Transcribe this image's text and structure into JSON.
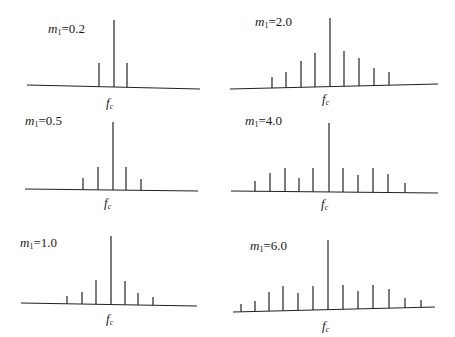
{
  "line_color": "#222222",
  "panels": [
    {
      "id": "p1",
      "label_var": "m",
      "label_sub": "1",
      "label_value": "=0.2",
      "label_pos": [
        48,
        22
      ],
      "fc_pos": [
        106,
        96
      ],
      "baseline": [
        27,
        85,
        200,
        89
      ],
      "lines": [
        [
          99,
          63
        ],
        [
          114,
          20
        ],
        [
          127,
          63
        ]
      ]
    },
    {
      "id": "p2",
      "label_var": "m",
      "label_sub": "1",
      "label_value": "=2.0",
      "label_pos": [
        255,
        15
      ],
      "fc_pos": [
        322,
        92
      ],
      "baseline": [
        230,
        89,
        438,
        84
      ],
      "lines": [
        [
          272,
          77
        ],
        [
          286,
          72
        ],
        [
          301,
          61
        ],
        [
          315,
          53
        ],
        [
          330,
          18
        ],
        [
          344,
          51
        ],
        [
          359,
          58
        ],
        [
          374,
          68
        ],
        [
          389,
          72
        ]
      ]
    },
    {
      "id": "p3",
      "label_var": "m",
      "label_sub": "1",
      "label_value": "=0.5",
      "label_pos": [
        25,
        114
      ],
      "fc_pos": [
        104,
        196
      ],
      "baseline": [
        25,
        189,
        198,
        191
      ],
      "lines": [
        [
          83,
          178
        ],
        [
          98,
          167
        ],
        [
          113,
          122
        ],
        [
          126,
          167
        ],
        [
          141,
          179
        ]
      ]
    },
    {
      "id": "p4",
      "label_var": "m",
      "label_sub": "1",
      "label_value": "=4.0",
      "label_pos": [
        245,
        114
      ],
      "fc_pos": [
        321,
        197
      ],
      "baseline": [
        231,
        191,
        438,
        193
      ],
      "lines": [
        [
          255,
          181
        ],
        [
          270,
          173
        ],
        [
          285,
          168
        ],
        [
          299,
          178
        ],
        [
          313,
          168
        ],
        [
          329,
          123
        ],
        [
          343,
          168
        ],
        [
          358,
          175
        ],
        [
          373,
          168
        ],
        [
          388,
          174
        ],
        [
          405,
          183
        ]
      ]
    },
    {
      "id": "p5",
      "label_var": "m",
      "label_sub": "1",
      "label_value": "=1.0",
      "label_pos": [
        20,
        236
      ],
      "fc_pos": [
        106,
        312
      ],
      "baseline": [
        21,
        303,
        197,
        306
      ],
      "lines": [
        [
          67,
          296
        ],
        [
          82,
          292
        ],
        [
          96,
          280
        ],
        [
          111,
          236
        ],
        [
          125,
          281
        ],
        [
          138,
          293
        ],
        [
          153,
          297
        ]
      ]
    },
    {
      "id": "p6",
      "label_var": "m",
      "label_sub": "1",
      "label_value": "=6.0",
      "label_pos": [
        250,
        239
      ],
      "fc_pos": [
        322,
        319
      ],
      "baseline": [
        233,
        312,
        435,
        307
      ],
      "lines": [
        [
          241,
          304
        ],
        [
          255,
          301
        ],
        [
          269,
          292
        ],
        [
          283,
          286
        ],
        [
          298,
          293
        ],
        [
          313,
          286
        ],
        [
          328,
          240
        ],
        [
          343,
          285
        ],
        [
          358,
          291
        ],
        [
          373,
          285
        ],
        [
          389,
          289
        ],
        [
          405,
          298
        ],
        [
          421,
          300
        ]
      ]
    }
  ],
  "fc_label": {
    "var": "f",
    "sub": "c"
  }
}
